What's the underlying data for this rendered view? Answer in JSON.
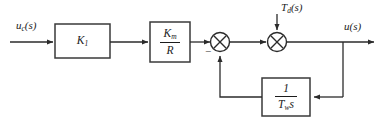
{
  "diagram": {
    "type": "control-block-diagram",
    "colors": {
      "line": "#2b2b2b",
      "block_border": "#3a3a3a",
      "background": "#ffffff",
      "text": "#1b1b1b"
    },
    "signals": {
      "input": {
        "base": "u",
        "subscript": "c",
        "arg": "(s)",
        "full": "u_c(s)"
      },
      "disturbance": {
        "base": "T",
        "subscript": "d",
        "arg": "(s)",
        "full": "T_d(s)"
      },
      "output": {
        "base": "u",
        "subscript": "",
        "arg": "(s)",
        "full": "u(s)"
      }
    },
    "blocks": [
      {
        "id": "gain-k1",
        "name": "K1 gain block",
        "label_base": "K",
        "label_sub": "1",
        "kind": "gain"
      },
      {
        "id": "gain-km-over-r",
        "name": "Km over R gain block",
        "numerator_base": "K",
        "numerator_sub": "m",
        "denominator": "R",
        "kind": "fraction"
      },
      {
        "id": "feedback-integrator",
        "name": "1 over Tw s feedback block",
        "numerator": "1",
        "denominator_base": "T",
        "denominator_sub": "w",
        "denominator_tail": "s",
        "kind": "fraction"
      }
    ],
    "summing_junctions": [
      {
        "id": "summer-1",
        "name": "first summing junction",
        "glyph": "cross-circle",
        "signs": [
          {
            "position": "lower-left",
            "symbol": "−"
          }
        ]
      },
      {
        "id": "summer-2",
        "name": "second summing junction",
        "glyph": "cross-circle",
        "signs": []
      }
    ],
    "connections": [
      {
        "from": "input",
        "to": "gain-k1"
      },
      {
        "from": "gain-k1",
        "to": "gain-km-over-r"
      },
      {
        "from": "gain-km-over-r",
        "to": "summer-1"
      },
      {
        "from": "summer-1",
        "to": "summer-2"
      },
      {
        "from": "disturbance",
        "to": "summer-2"
      },
      {
        "from": "summer-2",
        "to": "output"
      },
      {
        "from": "output-tap",
        "to": "feedback-integrator"
      },
      {
        "from": "feedback-integrator",
        "to": "summer-1"
      }
    ]
  }
}
